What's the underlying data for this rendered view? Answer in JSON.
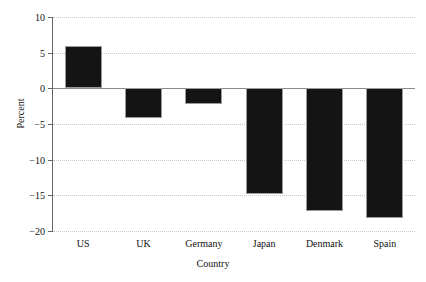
{
  "chart_data": {
    "type": "bar",
    "title": "",
    "xlabel": "Country",
    "ylabel": "Percent",
    "categories": [
      "US",
      "UK",
      "Germany",
      "Japan",
      "Denmark",
      "Spain"
    ],
    "values": [
      6,
      -4.1,
      -2.2,
      -14.8,
      -17.2,
      -18.2
    ],
    "ylim": [
      -20,
      10
    ],
    "yticks": [
      10,
      5,
      0,
      -5,
      -10,
      -15,
      -20
    ],
    "ytick_labels": [
      "10",
      "5",
      "0",
      "−5",
      "−10",
      "−15",
      "−20"
    ],
    "grid": true,
    "grid_style": "dotted",
    "legend": null,
    "bar_color": "#141414",
    "grid_color": "#c9c9c9",
    "axis_color": "#666666",
    "zero_line_color": "#8a8a8a"
  }
}
